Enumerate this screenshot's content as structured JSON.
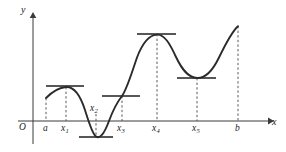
{
  "figure": {
    "kind": "calculus-graph",
    "background_color": "#ffffff",
    "curve_color": "#2b2b2b",
    "axis_color": "#3a3a3a",
    "dash_color": "#5a5a5a"
  },
  "axes": {
    "origin_label": "O",
    "x_label": "x",
    "y_label": "y",
    "x_axis_y_px": 121,
    "y_axis_x_px": 33,
    "x_axis_start_px": 18,
    "x_axis_end_px": 272,
    "y_axis_top_px": 14,
    "y_axis_bottom_px": 144
  },
  "x_ticks": [
    {
      "id": "a",
      "label": "a",
      "sub": "",
      "x_px": 46,
      "label_x_px": 43,
      "label_y_px": 124
    },
    {
      "id": "x1",
      "label": "x",
      "sub": "1",
      "x_px": 66,
      "label_x_px": 61,
      "label_y_px": 124
    },
    {
      "id": "x2",
      "label": "x",
      "sub": "2",
      "x_px": 96,
      "label_x_px": 91,
      "label_y_px": 107
    },
    {
      "id": "x3",
      "label": "x",
      "sub": "3",
      "x_px": 122,
      "label_x_px": 117,
      "label_y_px": 124
    },
    {
      "id": "x4",
      "label": "x",
      "sub": "4",
      "x_px": 157,
      "label_x_px": 152,
      "label_y_px": 124
    },
    {
      "id": "x5",
      "label": "x",
      "sub": "5",
      "x_px": 197,
      "label_x_px": 192,
      "label_y_px": 124
    },
    {
      "id": "b",
      "label": "b",
      "sub": "",
      "x_px": 238,
      "label_x_px": 235,
      "label_y_px": 124
    }
  ],
  "dashed_drops": [
    {
      "id": "drop-a",
      "x_px": 46,
      "y_top_px": 98,
      "y_bottom_px": 121
    },
    {
      "id": "drop-x1",
      "x_px": 66,
      "y_top_px": 87,
      "y_bottom_px": 121
    },
    {
      "id": "drop-x2",
      "x_px": 96,
      "y_top_px": 114,
      "y_bottom_px": 137
    },
    {
      "id": "drop-x3",
      "x_px": 122,
      "y_top_px": 96,
      "y_bottom_px": 121
    },
    {
      "id": "drop-x4",
      "x_px": 157,
      "y_top_px": 34,
      "y_bottom_px": 121
    },
    {
      "id": "drop-x5",
      "x_px": 197,
      "y_top_px": 78,
      "y_bottom_px": 121
    },
    {
      "id": "drop-b",
      "x_px": 238,
      "y_top_px": 26,
      "y_bottom_px": 121
    }
  ],
  "tangent_lines": [
    {
      "id": "tangent-x1",
      "x1_px": 46,
      "x2_px": 84,
      "y_px": 86
    },
    {
      "id": "tangent-x2",
      "x1_px": 79,
      "x2_px": 113,
      "y_px": 137
    },
    {
      "id": "tangent-x3",
      "x1_px": 102,
      "x2_px": 140,
      "y_px": 96
    },
    {
      "id": "tangent-x4",
      "x1_px": 137,
      "x2_px": 176,
      "y_px": 34
    },
    {
      "id": "tangent-x5",
      "x1_px": 177,
      "x2_px": 216,
      "y_px": 78
    }
  ],
  "curve": {
    "path": "M 46,98 C 52,92 58,87.5 66,87 C 74,86.6 80,95 85,110 C 89,122 92,133 96,136.5 C 100,140 104,134 109,122 C 115,108 118,101 122,96 C 127,89 131,76 137,58 C 143,42 149,35 157,34.5 C 165,34 170,44 176,57 C 182,69 188,77.5 197,78 C 206,78.5 212,72 219,58 C 226,44 231,32 238,26",
    "start": {
      "x_px": 46,
      "y_px": 98
    },
    "end": {
      "x_px": 238,
      "y_px": 26
    }
  },
  "critical_points": [
    {
      "id": "x1",
      "type": "local-maximum",
      "x_px": 66,
      "y_px": 87
    },
    {
      "id": "x2",
      "type": "local-minimum",
      "x_px": 96,
      "y_px": 137
    },
    {
      "id": "x3",
      "type": "inflection",
      "x_px": 122,
      "y_px": 96
    },
    {
      "id": "x4",
      "type": "local-maximum",
      "x_px": 157,
      "y_px": 34
    },
    {
      "id": "x5",
      "type": "local-minimum",
      "x_px": 197,
      "y_px": 78
    }
  ]
}
